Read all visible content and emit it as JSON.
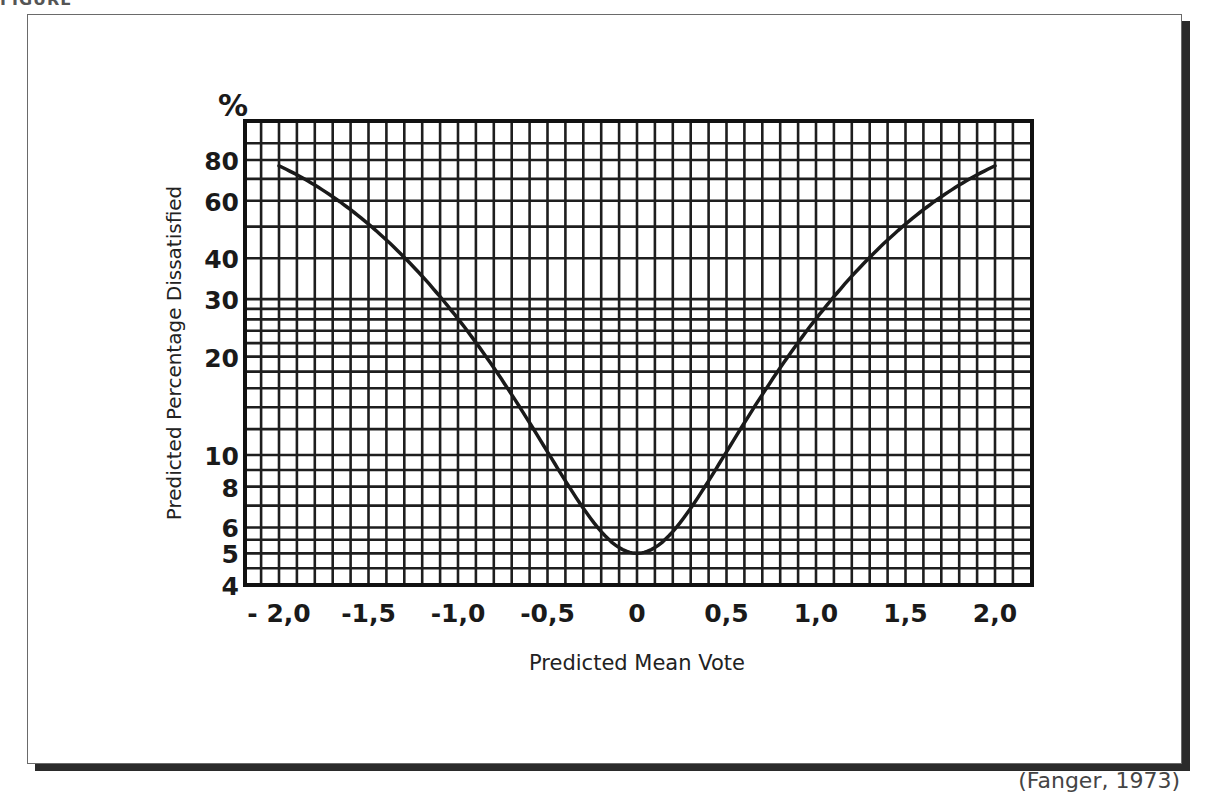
{
  "header": {
    "clipped_heading": "FIGURE"
  },
  "caption": "(Fanger, 1973)",
  "chart_data": {
    "type": "line",
    "title": "",
    "xlabel": "Predicted Mean Vote",
    "ylabel": "Predicted Percentage Dissatisfied",
    "y_unit_label": "%",
    "y_scale": "log",
    "xlim": [
      -2.0,
      2.0
    ],
    "ylim": [
      4,
      100
    ],
    "grid": true,
    "x_ticks": [
      "- 2,0",
      "-1,5",
      "-1,0",
      "-0,5",
      "0",
      "0,5",
      "1,0",
      "1,5",
      "2,0"
    ],
    "x_tick_values": [
      -2.0,
      -1.5,
      -1.0,
      -0.5,
      0,
      0.5,
      1.0,
      1.5,
      2.0
    ],
    "y_ticks": [
      "80",
      "60",
      "40",
      "30",
      "20",
      "10",
      "8",
      "6",
      "5",
      "4"
    ],
    "y_tick_values": [
      80,
      60,
      40,
      30,
      20,
      10,
      8,
      6,
      5,
      4
    ],
    "series": [
      {
        "name": "PPD vs PMV",
        "x": [
          -2.0,
          -1.75,
          -1.5,
          -1.25,
          -1.0,
          -0.75,
          -0.5,
          -0.25,
          0,
          0.25,
          0.5,
          0.75,
          1.0,
          1.25,
          1.5,
          1.75,
          2.0
        ],
        "y": [
          76.8,
          64.6,
          50.5,
          37.0,
          26.1,
          16.8,
          10.2,
          6.3,
          5.0,
          6.3,
          10.2,
          16.8,
          26.1,
          37.0,
          50.5,
          64.6,
          76.8
        ]
      }
    ]
  }
}
